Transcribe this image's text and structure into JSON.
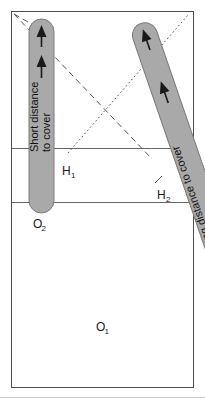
{
  "figure": {
    "frame": {
      "border_color": "#4d4d4d",
      "background_color": "#ffffff",
      "divider_color": "#666666",
      "divider_count": 2
    },
    "colors": {
      "capsule_fill": "#a9a9a9",
      "capsule_stroke": "#7a7a7a",
      "arrow_fill": "#1a1a1a",
      "sightline_color": "#555555",
      "text": "#1a1a1a"
    },
    "paths": {
      "short": {
        "label_line_1": "Short distance",
        "label_line_2": "to cover",
        "start_label": "O",
        "start_sub": "2",
        "orientation": "vertical",
        "arrow_count": 2
      },
      "long": {
        "label_line_1": "Long distance to cover",
        "start_label": "O",
        "start_sub": "1",
        "orientation": "diagonal",
        "arrow_count": 2
      }
    },
    "hides": [
      {
        "label": "H",
        "sub": "1",
        "line_style": "dotted"
      },
      {
        "label": "H",
        "sub": "2",
        "line_style": "dashed"
      }
    ],
    "sightlines": [
      {
        "name": "dashed-sightline",
        "style": "dashed"
      },
      {
        "name": "dotted-sightline",
        "style": "dotted"
      }
    ]
  }
}
